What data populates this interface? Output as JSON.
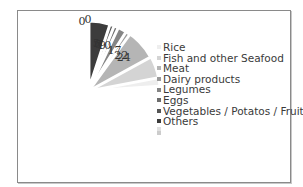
{
  "chart_data": {
    "type": "pie",
    "title": "",
    "categories": [
      "Rice",
      "Fish and other Seafood",
      "Meat",
      "Dairy products",
      "Legumes",
      "Eggs",
      "Vegetables / Potatos / Fruits",
      "Others",
      "",
      ""
    ],
    "values": [
      24,
      22,
      17,
      10,
      9,
      7,
      6,
      5,
      0,
      0
    ],
    "colors": [
      "#eeeeee",
      "#d4d4d4",
      "#b5b5b5",
      "#9a9a9a",
      "#858585",
      "#6d6d6d",
      "#565656",
      "#3c3c3c",
      "#e0e0e0",
      "#cccccc"
    ],
    "exploded": true,
    "legend_position": "right",
    "data_labels": [
      "24",
      "22",
      "17",
      "10",
      "9",
      "7",
      "6",
      "5",
      "0",
      "0"
    ]
  },
  "legend": {
    "items": [
      {
        "label": "Rice",
        "color": "#eeeeee"
      },
      {
        "label": "Fish and other Seafood",
        "color": "#d4d4d4"
      },
      {
        "label": "Meat",
        "color": "#b5b5b5"
      },
      {
        "label": "Dairy products",
        "color": "#9a9a9a"
      },
      {
        "label": "Legumes",
        "color": "#858585"
      },
      {
        "label": "Eggs",
        "color": "#6d6d6d"
      },
      {
        "label": "Vegetables / Potatos / Fruits",
        "color": "#565656"
      },
      {
        "label": "Others",
        "color": "#3c3c3c"
      },
      {
        "label": "",
        "color": "#e0e0e0"
      },
      {
        "label": "",
        "color": "#cccccc"
      }
    ]
  }
}
